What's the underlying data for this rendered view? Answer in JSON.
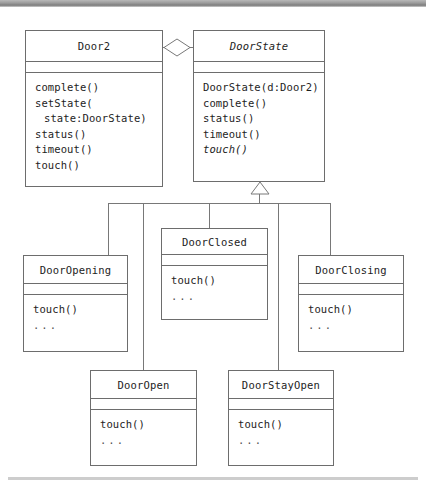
{
  "diagram": {
    "type": "uml-class-diagram",
    "colors": {
      "box_border": "#6d6d6d",
      "connector": "#787878",
      "text": "#1d1d1d",
      "background": "#ffffff",
      "top_bar": "#9a9a9a",
      "bottom_bar": "#cdcdcd"
    },
    "classes": [
      {
        "id": "door2",
        "name": "Door2",
        "abstract": false,
        "attributes": [],
        "operations": [
          {
            "text": "complete()",
            "abstract": false,
            "continuation": false
          },
          {
            "text": "setState(",
            "abstract": false,
            "continuation": false
          },
          {
            "text": "state:DoorState)",
            "abstract": false,
            "continuation": true
          },
          {
            "text": "status()",
            "abstract": false,
            "continuation": false
          },
          {
            "text": "timeout()",
            "abstract": false,
            "continuation": false
          },
          {
            "text": "touch()",
            "abstract": false,
            "continuation": false
          }
        ]
      },
      {
        "id": "doorstate",
        "name": "DoorState",
        "abstract": true,
        "attributes": [],
        "operations": [
          {
            "text": "DoorState(d:Door2)",
            "abstract": false,
            "continuation": false
          },
          {
            "text": "complete()",
            "abstract": false,
            "continuation": false
          },
          {
            "text": "status()",
            "abstract": false,
            "continuation": false
          },
          {
            "text": "timeout()",
            "abstract": false,
            "continuation": false
          },
          {
            "text": "touch()",
            "abstract": true,
            "continuation": false
          }
        ]
      },
      {
        "id": "dooropening",
        "name": "DoorOpening",
        "abstract": false,
        "attributes": [],
        "operations": [
          {
            "text": "touch()",
            "abstract": false,
            "continuation": false
          },
          {
            "text": "...",
            "abstract": false,
            "continuation": false
          }
        ]
      },
      {
        "id": "doorclosed",
        "name": "DoorClosed",
        "abstract": false,
        "attributes": [],
        "operations": [
          {
            "text": "touch()",
            "abstract": false,
            "continuation": false
          },
          {
            "text": "...",
            "abstract": false,
            "continuation": false
          }
        ]
      },
      {
        "id": "doorclosing",
        "name": "DoorClosing",
        "abstract": false,
        "attributes": [],
        "operations": [
          {
            "text": "touch()",
            "abstract": false,
            "continuation": false
          },
          {
            "text": "...",
            "abstract": false,
            "continuation": false
          }
        ]
      },
      {
        "id": "dooropen",
        "name": "DoorOpen",
        "abstract": false,
        "attributes": [],
        "operations": [
          {
            "text": "touch()",
            "abstract": false,
            "continuation": false
          },
          {
            "text": "...",
            "abstract": false,
            "continuation": false
          }
        ]
      },
      {
        "id": "doorstayopen",
        "name": "DoorStayOpen",
        "abstract": false,
        "attributes": [],
        "operations": [
          {
            "text": "touch()",
            "abstract": false,
            "continuation": false
          },
          {
            "text": "...",
            "abstract": false,
            "continuation": false
          }
        ]
      }
    ],
    "relationships": [
      {
        "kind": "aggregation",
        "from": "door2",
        "to": "doorstate",
        "marker": "open-diamond"
      },
      {
        "kind": "generalization",
        "from": "dooropening",
        "to": "doorstate",
        "marker": "hollow-triangle"
      },
      {
        "kind": "generalization",
        "from": "doorclosed",
        "to": "doorstate",
        "marker": "hollow-triangle"
      },
      {
        "kind": "generalization",
        "from": "doorclosing",
        "to": "doorstate",
        "marker": "hollow-triangle"
      },
      {
        "kind": "generalization",
        "from": "dooropen",
        "to": "doorstate",
        "marker": "hollow-triangle"
      },
      {
        "kind": "generalization",
        "from": "doorstayopen",
        "to": "doorstate",
        "marker": "hollow-triangle"
      }
    ]
  }
}
